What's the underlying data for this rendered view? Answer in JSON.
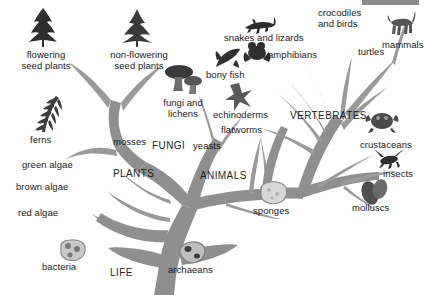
{
  "diagram": {
    "type": "phylogenetic-tree",
    "background_color": "#ffffff",
    "branch_color": "#8f8f8f",
    "twig_color": "#9a9a9a",
    "text_color": "#1a1a1a",
    "icon_color": "#3a3a3a",
    "artifact_color": "#8c8c8c"
  },
  "root": {
    "label": "LIFE"
  },
  "major_groups": [
    {
      "key": "plants",
      "label": "PLANTS"
    },
    {
      "key": "fungi",
      "label": "FUNGI"
    },
    {
      "key": "animals",
      "label": "ANIMALS"
    },
    {
      "key": "vertebrates",
      "label": "VERTEBRATES"
    }
  ],
  "labels": [
    {
      "key": "flowering-seed-plants",
      "label": "flowering\nseed plants",
      "icon": "conifer-tree-icon"
    },
    {
      "key": "non-flowering-seed-plants",
      "label": "non-flowering\nseed plants",
      "icon": "pine-tree-icon"
    },
    {
      "key": "ferns",
      "label": "ferns",
      "icon": "fern-icon"
    },
    {
      "key": "mosses",
      "label": "mosses",
      "icon": null
    },
    {
      "key": "green-algae",
      "label": "green algae",
      "icon": null
    },
    {
      "key": "brown-algae",
      "label": "brown algae",
      "icon": null
    },
    {
      "key": "red-algae",
      "label": "red algae",
      "icon": null
    },
    {
      "key": "fungi-and-lichens",
      "label": "fungi and\nlichens",
      "icon": "mushroom-icon"
    },
    {
      "key": "yeasts",
      "label": "yeasts",
      "icon": null
    },
    {
      "key": "bacteria",
      "label": "bacteria",
      "icon": "bacteria-icon"
    },
    {
      "key": "archaeans",
      "label": "archaeans",
      "icon": "archaean-icon"
    },
    {
      "key": "sponges",
      "label": "sponges",
      "icon": "sponge-icon"
    },
    {
      "key": "flatworms",
      "label": "flatworms",
      "icon": null
    },
    {
      "key": "echinoderms",
      "label": "echinoderms",
      "icon": "starfish-icon"
    },
    {
      "key": "molluscs",
      "label": "molluscs",
      "icon": "mollusc-icon"
    },
    {
      "key": "insects",
      "label": "insects",
      "icon": "insect-icon"
    },
    {
      "key": "crustaceans",
      "label": "crustaceans",
      "icon": "crustacean-icon"
    },
    {
      "key": "bony-fish",
      "label": "bony fish",
      "icon": "fish-icon"
    },
    {
      "key": "amphibians",
      "label": "amphibians",
      "icon": "frog-icon"
    },
    {
      "key": "snakes-and-lizards",
      "label": "snakes and lizards",
      "icon": "lizard-icon"
    },
    {
      "key": "crocodiles-and-birds",
      "label": "crocodiles\nand birds",
      "icon": null
    },
    {
      "key": "turtles",
      "label": "turtles",
      "icon": null
    },
    {
      "key": "mammals",
      "label": "mammals",
      "icon": "mammal-icon"
    }
  ]
}
